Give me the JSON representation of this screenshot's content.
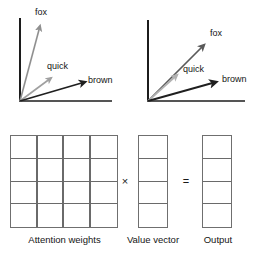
{
  "figure": {
    "width": 258,
    "height": 256,
    "background": "#ffffff"
  },
  "colors": {
    "axis": "#1c1c1c",
    "arrow_dark": "#1f1f1f",
    "arrow_mid": "#6e6e6e",
    "arrow_light": "#a8a8a8",
    "grid_border": "#6f6f6f",
    "grid_line": "#6a6a6a",
    "text": "#141414"
  },
  "panels": {
    "left_vector_plot": {
      "name": "before-attention",
      "axis": {
        "origin": [
          20,
          101
        ],
        "y_top": [
          20,
          18
        ],
        "x_right": [
          112,
          101
        ]
      },
      "arrows": [
        {
          "label": "fox",
          "color": "#8f8f8f",
          "from": [
            20,
            101
          ],
          "to": [
            40,
            24
          ],
          "label_pos": [
            34,
            6
          ],
          "width": 1.6
        },
        {
          "label": "quick",
          "color": "#a0a0a0",
          "from": [
            20,
            101
          ],
          "to": [
            52,
            77
          ],
          "label_pos": [
            47,
            61
          ],
          "width": 1.6
        },
        {
          "label": "brown",
          "color": "#1f1f1f",
          "from": [
            20,
            101
          ],
          "to": [
            87,
            82
          ],
          "label_pos": [
            88,
            75
          ],
          "width": 1.8
        }
      ]
    },
    "right_vector_plot": {
      "name": "after-attention",
      "axis": {
        "origin": [
          148,
          101
        ],
        "y_top": [
          148,
          20
        ],
        "x_right": [
          245,
          101
        ]
      },
      "arrows": [
        {
          "label": "fox",
          "color": "#5a5a5a",
          "from": [
            148,
            101
          ],
          "to": [
            206,
            43
          ],
          "label_pos": [
            210,
            27
          ],
          "width": 1.7
        },
        {
          "label": "quick",
          "color": "#b2b2b2",
          "from": [
            148,
            101
          ],
          "to": [
            178,
            73
          ],
          "label_pos": [
            183,
            64
          ],
          "width": 1.7
        },
        {
          "label": "brown",
          "color": "#1f1f1f",
          "from": [
            148,
            101
          ],
          "to": [
            218,
            81
          ],
          "label_pos": [
            222,
            74
          ],
          "width": 1.9
        }
      ]
    }
  },
  "matrix_section": {
    "attention_weights": {
      "label": "Attention weights",
      "rows": 4,
      "cols": 4
    },
    "value_vector": {
      "label": "Value vector",
      "rows": 4,
      "cols": 1
    },
    "output": {
      "label": "Output",
      "rows": 4,
      "cols": 1
    },
    "operators": {
      "multiply": "×",
      "equals": "="
    }
  },
  "labels": {
    "fox": "fox",
    "quick": "quick",
    "brown": "brown"
  }
}
